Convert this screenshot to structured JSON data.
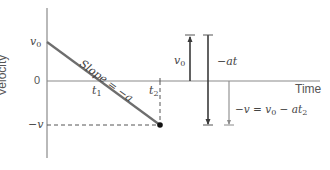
{
  "diagram": {
    "type": "velocity-time graph",
    "y_axis_label": "Velocity",
    "x_axis_label": "Time",
    "y_ticks": {
      "v0": "v",
      "v0_sub": "0",
      "zero": "0",
      "neg_v": "−v"
    },
    "x_ticks": {
      "t1": "t",
      "t1_sub": "1",
      "t2": "t",
      "t2_sub": "2"
    },
    "slope_label": "Slope = −a",
    "vector_labels": {
      "v0": "v",
      "v0_sub": "0",
      "neg_at": "−at",
      "equation_prefix": "−v = v",
      "equation_sub0": "0",
      "equation_mid": " − at",
      "equation_sub2": "2"
    },
    "colors": {
      "axis": "#8a8a8a",
      "line": "#6e6e6e",
      "arrow": "#3a3a3a",
      "dashed": "#555555",
      "text": "#444444"
    }
  }
}
